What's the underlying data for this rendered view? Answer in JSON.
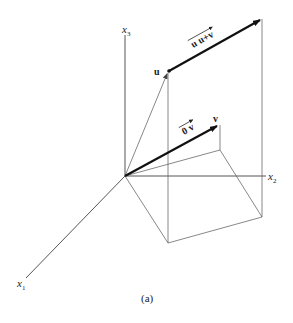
{
  "figure": {
    "caption": "(a)",
    "axes": {
      "x1": {
        "base": "x",
        "sub": "1"
      },
      "x2": {
        "base": "x",
        "sub": "2"
      },
      "x3": {
        "base": "x",
        "sub": "3"
      }
    },
    "points": {
      "u": "u",
      "v": "v"
    },
    "vectors": {
      "u_to_u_plus_v": "u u+v",
      "zero_to_v": "0 v"
    },
    "colors": {
      "bold_vector": "#111111",
      "thin_line": "#6a6a6a",
      "axis": "#555555"
    }
  }
}
